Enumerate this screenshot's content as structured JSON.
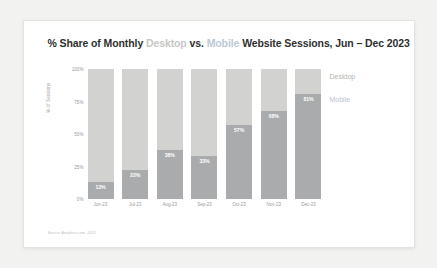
{
  "card": {
    "title_prefix": "% Share of Monthly",
    "title_word_desktop": "Desktop",
    "title_mid": "vs.",
    "title_word_mobile": "Mobile",
    "title_suffix": "Website Sessions, Jun – Dec 2023",
    "source": "Source: Analytics.com, 2023"
  },
  "legend": {
    "desktop": "Desktop",
    "mobile": "Mobile"
  },
  "colors": {
    "desktop_bar": "#d2d2d0",
    "mobile_bar": "#a9abad",
    "title_desktop_word": "#c7c7c5",
    "title_mobile_word": "#bcc9d6",
    "card_background": "#ffffff",
    "page_background": "#f2f2f1",
    "axis_text": "#9a9a99"
  },
  "chart_data": {
    "type": "bar",
    "title": "% Share of Monthly Desktop vs. Mobile Website Sessions, Jun – Dec 2023",
    "xlabel": "",
    "ylabel": "% of Sessions",
    "ylim": [
      0,
      100
    ],
    "yticks": [
      "100%",
      "75%",
      "50%",
      "25%",
      "0%"
    ],
    "ytick_values": [
      100,
      75,
      50,
      25,
      0
    ],
    "grid": false,
    "stacked": true,
    "legend_position": "right",
    "categories": [
      "Jun-23",
      "Jul-23",
      "Aug-23",
      "Sep-23",
      "Oct-23",
      "Nov-23",
      "Dec-23"
    ],
    "series": [
      {
        "name": "Mobile",
        "values": [
          13,
          22,
          38,
          33,
          57,
          68,
          81
        ],
        "labels": [
          "13%",
          "22%",
          "38%",
          "33%",
          "57%",
          "68%",
          "81%"
        ]
      },
      {
        "name": "Desktop",
        "values": [
          87,
          78,
          62,
          67,
          43,
          32,
          19
        ],
        "labels": [
          "",
          "",
          "",
          "",
          "",
          "",
          ""
        ]
      }
    ]
  }
}
